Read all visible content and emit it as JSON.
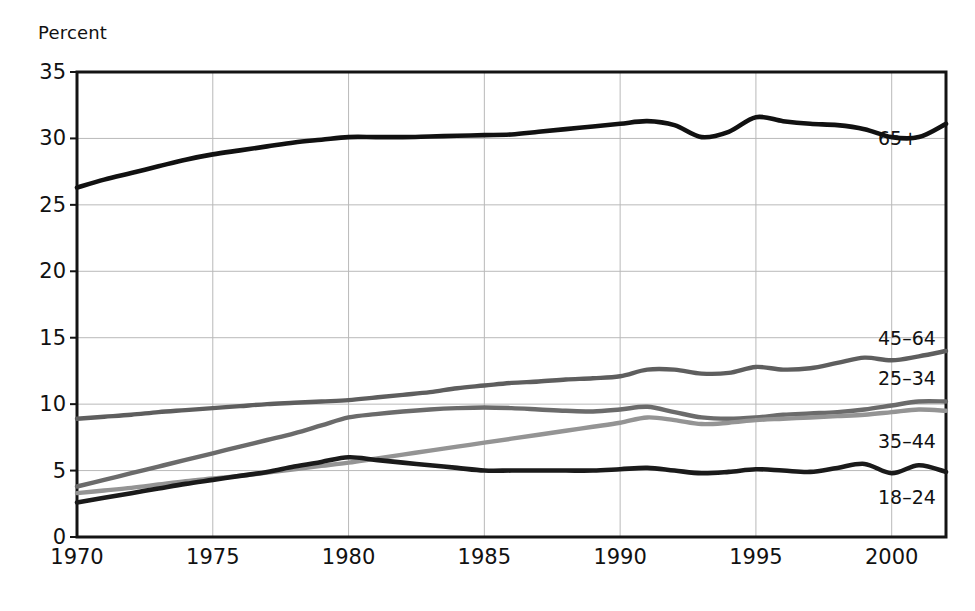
{
  "chart_data": {
    "type": "line",
    "title": "",
    "subtitle": "",
    "ylabel": "Percent",
    "xlabel": "",
    "xlim": [
      1970,
      2002
    ],
    "ylim": [
      0,
      35
    ],
    "grid": true,
    "legend_position": "inline-right",
    "y_ticks": [
      0,
      5,
      10,
      15,
      20,
      25,
      30,
      35
    ],
    "y_tick_labels": [
      "0",
      "5",
      "10",
      "15",
      "20",
      "25",
      "30",
      "35"
    ],
    "x_ticks": [
      1970,
      1975,
      1980,
      1985,
      1990,
      1995,
      2000
    ],
    "x_tick_labels": [
      "1970",
      "1975",
      "1980",
      "1985",
      "1990",
      "1995",
      "2000"
    ],
    "x": [
      1970,
      1971,
      1972,
      1973,
      1974,
      1975,
      1976,
      1977,
      1978,
      1979,
      1980,
      1981,
      1982,
      1983,
      1984,
      1985,
      1986,
      1987,
      1988,
      1989,
      1990,
      1991,
      1992,
      1993,
      1994,
      1995,
      1996,
      1997,
      1998,
      1999,
      2000,
      2001,
      2002
    ],
    "series": [
      {
        "name": "65+",
        "label": "65+",
        "color": "#111111",
        "width": 4.6,
        "label_value": 30.0,
        "values": [
          26.3,
          26.9,
          27.4,
          27.9,
          28.4,
          28.8,
          29.1,
          29.4,
          29.7,
          29.9,
          30.1,
          30.1,
          30.1,
          30.15,
          30.2,
          30.25,
          30.3,
          30.5,
          30.7,
          30.9,
          31.1,
          31.3,
          31.0,
          30.1,
          30.5,
          31.6,
          31.3,
          31.1,
          31.0,
          30.7,
          30.1,
          30.1,
          31.1
        ]
      },
      {
        "name": "45-64",
        "label": "45–64",
        "color": "#5e5e5e",
        "width": 4.4,
        "label_value": 15.0,
        "values": [
          8.9,
          9.05,
          9.2,
          9.4,
          9.55,
          9.7,
          9.85,
          10.0,
          10.1,
          10.2,
          10.3,
          10.5,
          10.7,
          10.9,
          11.2,
          11.4,
          11.6,
          11.7,
          11.85,
          11.95,
          12.1,
          12.6,
          12.6,
          12.3,
          12.35,
          12.8,
          12.6,
          12.7,
          13.1,
          13.5,
          13.3,
          13.6,
          14.0
        ]
      },
      {
        "name": "25-34",
        "label": "25–34",
        "color": "#6b6b6b",
        "width": 4.4,
        "label_value": 12.0,
        "values": [
          3.8,
          4.3,
          4.8,
          5.3,
          5.8,
          6.3,
          6.8,
          7.3,
          7.8,
          8.4,
          9.0,
          9.25,
          9.45,
          9.6,
          9.7,
          9.75,
          9.7,
          9.6,
          9.5,
          9.45,
          9.6,
          9.8,
          9.4,
          9.0,
          8.9,
          9.0,
          9.2,
          9.3,
          9.4,
          9.6,
          9.9,
          10.2,
          10.2
        ]
      },
      {
        "name": "35-44",
        "label": "35–44",
        "color": "#949494",
        "width": 4.4,
        "label_value": 7.2,
        "values": [
          3.3,
          3.5,
          3.7,
          3.95,
          4.2,
          4.4,
          4.6,
          4.85,
          5.1,
          5.35,
          5.6,
          5.9,
          6.2,
          6.5,
          6.8,
          7.1,
          7.4,
          7.7,
          8.0,
          8.3,
          8.6,
          9.0,
          8.8,
          8.5,
          8.6,
          8.8,
          8.9,
          9.0,
          9.1,
          9.2,
          9.4,
          9.6,
          9.5
        ]
      },
      {
        "name": "18-24",
        "label": "18–24",
        "color": "#1a1a1a",
        "width": 4.6,
        "label_value": 3.0,
        "values": [
          2.6,
          2.95,
          3.3,
          3.65,
          4.0,
          4.3,
          4.6,
          4.9,
          5.3,
          5.65,
          6.0,
          5.8,
          5.6,
          5.4,
          5.2,
          5.0,
          5.0,
          5.0,
          5.0,
          5.0,
          5.1,
          5.2,
          5.0,
          4.8,
          4.9,
          5.1,
          5.0,
          4.9,
          5.2,
          5.5,
          4.8,
          5.4,
          4.9
        ]
      }
    ]
  }
}
